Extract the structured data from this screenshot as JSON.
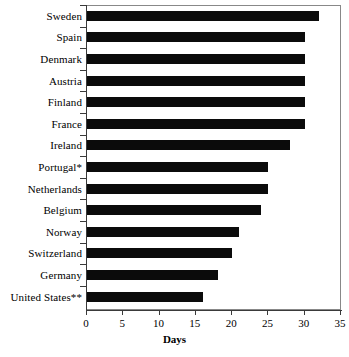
{
  "chart_data": {
    "type": "bar",
    "orientation": "horizontal",
    "title": "",
    "xlabel": "Days",
    "ylabel": "",
    "xlim": [
      0,
      35
    ],
    "xticks": [
      0,
      5,
      10,
      15,
      20,
      25,
      30,
      35
    ],
    "grid": false,
    "legend": null,
    "bar_color": "#0b0b0b",
    "categories": [
      "Sweden",
      "Spain",
      "Denmark",
      "Austria",
      "Finland",
      "France",
      "Ireland",
      "Portugal*",
      "Netherlands",
      "Belgium",
      "Norway",
      "Switzerland",
      "Germany",
      "United States**"
    ],
    "values": [
      32,
      30,
      30,
      30,
      30,
      30,
      28,
      25,
      25,
      24,
      21,
      20,
      18,
      16
    ]
  },
  "footnote": ""
}
